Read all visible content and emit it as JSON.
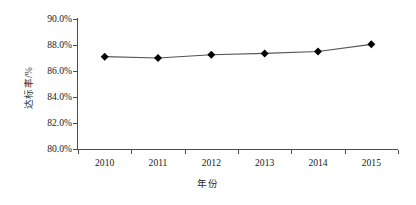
{
  "chart_data": {
    "type": "line",
    "title": "",
    "xlabel": "年份",
    "ylabel": "达标率/%",
    "categories": [
      "2010",
      "2011",
      "2012",
      "2013",
      "2014",
      "2015"
    ],
    "values": [
      87.1,
      87.0,
      87.25,
      87.35,
      87.5,
      88.05
    ],
    "series": [
      {
        "name": "达标率",
        "values": [
          87.1,
          87.0,
          87.25,
          87.35,
          87.5,
          88.05
        ]
      }
    ],
    "ylim": [
      80.0,
      90.0
    ],
    "ytick_values": [
      80.0,
      82.0,
      84.0,
      86.0,
      88.0,
      90.0
    ],
    "ytick_labels": [
      "80.0%",
      "82.0%",
      "84.0%",
      "86.0%",
      "88.0%",
      "90.0%"
    ],
    "xtick_labels": [
      "2010",
      "2011",
      "2012",
      "2013",
      "2014",
      "2015"
    ],
    "grid": false,
    "legend": false,
    "legend_position": "none",
    "marker": "diamond",
    "line_color": "#555555",
    "marker_color": "#000000",
    "axis_color": "#4d4d4d",
    "background_color": "#ffffff"
  }
}
